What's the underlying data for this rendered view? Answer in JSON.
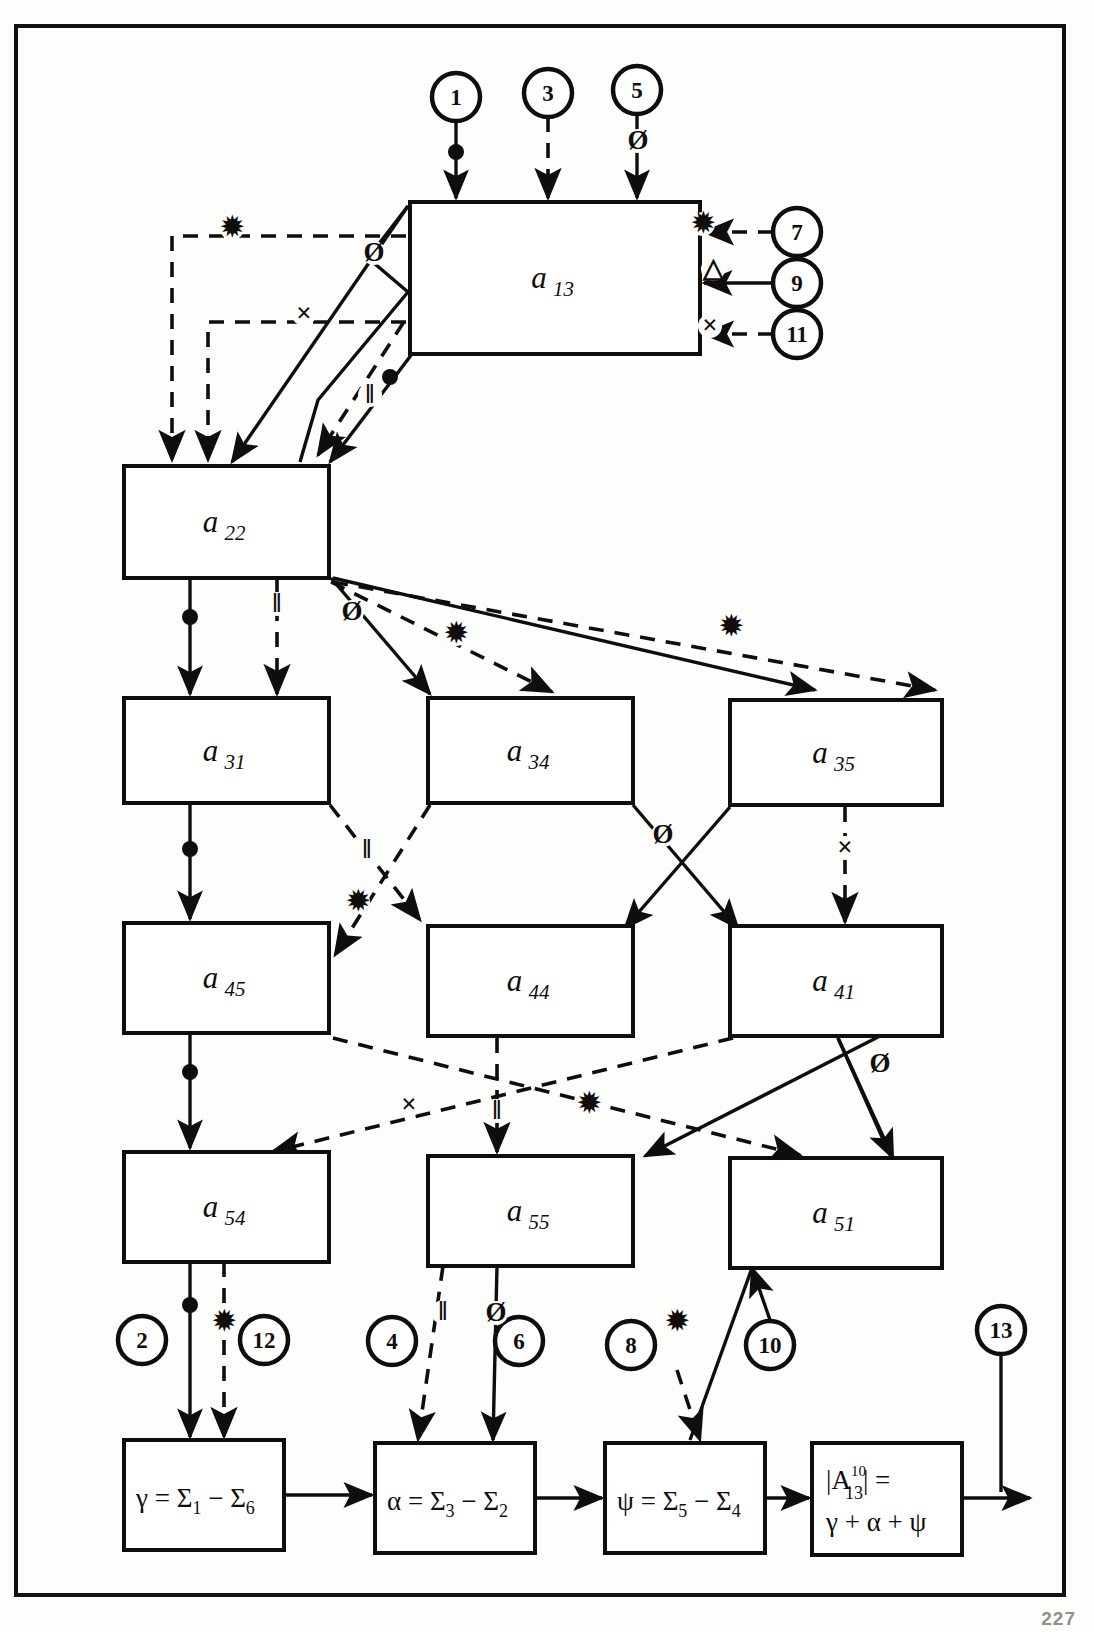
{
  "document": {
    "title": "Signal flow diagram with summation blocks",
    "page_number": "227"
  },
  "blocks": [
    {
      "id": "a13",
      "base": "a",
      "sub": "13",
      "x": 410,
      "y": 202,
      "w": 290,
      "h": 152
    },
    {
      "id": "a22",
      "base": "a",
      "sub": "22",
      "x": 124,
      "y": 466,
      "w": 205,
      "h": 112
    },
    {
      "id": "a31",
      "base": "a",
      "sub": "31",
      "x": 124,
      "y": 698,
      "w": 205,
      "h": 105
    },
    {
      "id": "a34",
      "base": "a",
      "sub": "34",
      "x": 428,
      "y": 698,
      "w": 205,
      "h": 105
    },
    {
      "id": "a35",
      "base": "a",
      "sub": "35",
      "x": 730,
      "y": 700,
      "w": 212,
      "h": 105
    },
    {
      "id": "a45",
      "base": "a",
      "sub": "45",
      "x": 124,
      "y": 923,
      "w": 205,
      "h": 110
    },
    {
      "id": "a44",
      "base": "a",
      "sub": "44",
      "x": 428,
      "y": 926,
      "w": 205,
      "h": 110
    },
    {
      "id": "a41",
      "base": "a",
      "sub": "41",
      "x": 730,
      "y": 926,
      "w": 212,
      "h": 110
    },
    {
      "id": "a54",
      "base": "a",
      "sub": "54",
      "x": 124,
      "y": 1152,
      "w": 205,
      "h": 110
    },
    {
      "id": "a55",
      "base": "a",
      "sub": "55",
      "x": 428,
      "y": 1156,
      "w": 205,
      "h": 110
    },
    {
      "id": "a51",
      "base": "a",
      "sub": "51",
      "x": 730,
      "y": 1158,
      "w": 212,
      "h": 110
    }
  ],
  "formula_blocks": [
    {
      "id": "gamma",
      "x": 124,
      "y": 1440,
      "w": 160,
      "h": 110,
      "lines": [
        {
          "parts": [
            {
              "t": "γ = ",
              "k": "base"
            },
            {
              "t": "Σ",
              "k": "base"
            },
            {
              "t": "1",
              "k": "sub"
            },
            {
              "t": " − ",
              "k": "base"
            },
            {
              "t": "Σ",
              "k": "base"
            },
            {
              "t": "6",
              "k": "sub"
            }
          ]
        }
      ]
    },
    {
      "id": "alpha",
      "x": 375,
      "y": 1443,
      "w": 160,
      "h": 110,
      "lines": [
        {
          "parts": [
            {
              "t": "α = ",
              "k": "base"
            },
            {
              "t": "Σ",
              "k": "base"
            },
            {
              "t": "3",
              "k": "sub"
            },
            {
              "t": " − ",
              "k": "base"
            },
            {
              "t": "Σ",
              "k": "base"
            },
            {
              "t": "2",
              "k": "sub"
            }
          ]
        }
      ]
    },
    {
      "id": "psi",
      "x": 605,
      "y": 1443,
      "w": 160,
      "h": 110,
      "lines": [
        {
          "parts": [
            {
              "t": "ψ = ",
              "k": "base"
            },
            {
              "t": "Σ",
              "k": "base"
            },
            {
              "t": "5",
              "k": "sub"
            },
            {
              "t": " − ",
              "k": "base"
            },
            {
              "t": "Σ",
              "k": "base"
            },
            {
              "t": "4",
              "k": "sub"
            }
          ]
        }
      ]
    }
  ],
  "result_block": {
    "id": "result",
    "x": 812,
    "y": 1443,
    "w": 150,
    "h": 112,
    "line1_prefix": "|A",
    "line1_sup": "10",
    "line1_sub": "13",
    "line1_suffix": "| =",
    "line2": "γ + α + ψ"
  },
  "tags": [
    {
      "n": "1",
      "cx": 456,
      "cy": 97,
      "r": 24
    },
    {
      "n": "3",
      "cx": 548,
      "cy": 93,
      "r": 24
    },
    {
      "n": "5",
      "cx": 637,
      "cy": 90,
      "r": 24
    },
    {
      "n": "7",
      "cx": 797,
      "cy": 232,
      "r": 24
    },
    {
      "n": "9",
      "cx": 797,
      "cy": 283,
      "r": 24
    },
    {
      "n": "11",
      "cx": 797,
      "cy": 334,
      "r": 24
    },
    {
      "n": "2",
      "cx": 142,
      "cy": 1340,
      "r": 24
    },
    {
      "n": "12",
      "cx": 264,
      "cy": 1340,
      "r": 24
    },
    {
      "n": "4",
      "cx": 392,
      "cy": 1341,
      "r": 24
    },
    {
      "n": "6",
      "cx": 519,
      "cy": 1341,
      "r": 24
    },
    {
      "n": "8",
      "cx": 631,
      "cy": 1345,
      "r": 24
    },
    {
      "n": "10",
      "cx": 770,
      "cy": 1345,
      "r": 24
    },
    {
      "n": "13",
      "cx": 1001,
      "cy": 1330,
      "r": 24
    }
  ],
  "edge_markers": [
    {
      "glyph": "✹",
      "x": 232,
      "y": 236,
      "name": "asterisk"
    },
    {
      "glyph": "×",
      "x": 304,
      "y": 322,
      "name": "cross"
    },
    {
      "glyph": "✹",
      "x": 703,
      "y": 232,
      "name": "asterisk"
    },
    {
      "glyph": "△",
      "x": 713,
      "y": 277,
      "name": "triangle"
    },
    {
      "glyph": "×",
      "x": 710,
      "y": 334,
      "name": "cross"
    },
    {
      "glyph": "Ø",
      "x": 374,
      "y": 261,
      "name": "phi"
    },
    {
      "glyph": "‖",
      "x": 370,
      "y": 403,
      "name": "double-bar"
    },
    {
      "glyph": "Ø",
      "x": 352,
      "y": 620,
      "name": "phi"
    },
    {
      "glyph": "✹",
      "x": 456,
      "y": 642,
      "name": "asterisk"
    },
    {
      "glyph": "✹",
      "x": 731,
      "y": 635,
      "name": "asterisk"
    },
    {
      "glyph": "‖",
      "x": 367,
      "y": 858,
      "name": "double-bar"
    },
    {
      "glyph": "✹",
      "x": 358,
      "y": 910,
      "name": "asterisk"
    },
    {
      "glyph": "Ø",
      "x": 663,
      "y": 843,
      "name": "phi"
    },
    {
      "glyph": "×",
      "x": 845,
      "y": 856,
      "name": "cross"
    },
    {
      "glyph": "×",
      "x": 409,
      "y": 1113,
      "name": "cross"
    },
    {
      "glyph": "‖",
      "x": 497,
      "y": 1119,
      "name": "double-bar"
    },
    {
      "glyph": "✹",
      "x": 589,
      "y": 1112,
      "name": "asterisk"
    },
    {
      "glyph": "Ø",
      "x": 880,
      "y": 1072,
      "name": "phi"
    },
    {
      "glyph": "‖",
      "x": 277,
      "y": 612,
      "name": "double-bar"
    },
    {
      "glyph": "✹",
      "x": 224,
      "y": 1330,
      "name": "asterisk"
    },
    {
      "glyph": "‖",
      "x": 443,
      "y": 1320,
      "name": "double-bar"
    },
    {
      "glyph": "Ø",
      "x": 496,
      "y": 1321,
      "name": "phi"
    },
    {
      "glyph": "✹",
      "x": 677,
      "y": 1330,
      "name": "asterisk"
    },
    {
      "glyph": "Ø",
      "x": 638,
      "y": 149,
      "name": "phi"
    }
  ]
}
